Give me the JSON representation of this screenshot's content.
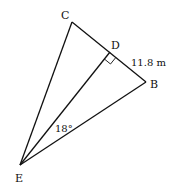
{
  "diagram": {
    "type": "geometry",
    "points": {
      "C": {
        "label": "C",
        "x": 72,
        "y": 22
      },
      "D": {
        "label": "D",
        "x": 110,
        "y": 52
      },
      "B": {
        "label": "B",
        "x": 146,
        "y": 82
      },
      "E": {
        "label": "E",
        "x": 20,
        "y": 165
      }
    },
    "segments": [
      "CB",
      "CE",
      "DE",
      "BE"
    ],
    "right_angle_at": "D",
    "annotations": {
      "side_DB": "11.8 m",
      "angle_DEB": "18°"
    },
    "colors": {
      "line": "#111111",
      "background": "#ffffff"
    }
  }
}
